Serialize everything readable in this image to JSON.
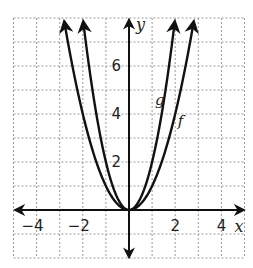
{
  "chart_data": {
    "type": "line",
    "title": "",
    "xlabel": "x",
    "ylabel": "y",
    "xlim": [
      -5,
      5
    ],
    "ylim": [
      -2,
      8
    ],
    "grid": true,
    "grid_style": "dashed",
    "x_ticks": [
      -4,
      -2,
      2,
      4
    ],
    "x_tick_labels": [
      "−4",
      "−2",
      "2",
      "4"
    ],
    "y_ticks": [
      2,
      4,
      6
    ],
    "y_tick_labels": [
      "2",
      "4",
      "6"
    ],
    "series": [
      {
        "name": "f",
        "equation": "f(x) = x^2",
        "a": 1,
        "x": [
          -2.8,
          -2,
          -1,
          0,
          1,
          2,
          2.8
        ],
        "y": [
          7.84,
          4,
          1,
          0,
          1,
          4,
          7.84
        ],
        "label_position": [
          2.2,
          3.7
        ]
      },
      {
        "name": "g",
        "equation": "g(x) = 2x^2",
        "a": 2,
        "x": [
          -2,
          -1.5,
          -1,
          0,
          1,
          1.5,
          2
        ],
        "y": [
          8,
          4.5,
          2,
          0,
          2,
          4.5,
          8
        ],
        "label_position": [
          1.3,
          4.6
        ]
      }
    ],
    "legend": null
  },
  "labels": {
    "x_axis": "x",
    "y_axis": "y",
    "ticks_x": [
      "−4",
      "−2",
      "2",
      "4"
    ],
    "ticks_y": [
      "2",
      "4",
      "6"
    ],
    "curve_f": "f",
    "curve_g": "g"
  },
  "colors": {
    "curve": "#111111",
    "axis": "#111111",
    "grid": "#9a9a9a",
    "background": "#ffffff"
  }
}
